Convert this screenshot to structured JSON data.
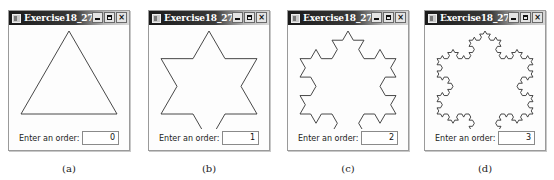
{
  "windows": [
    {
      "title": "Exercise18_27",
      "label": "Enter an order:",
      "order": "0",
      "caption": "(a)"
    },
    {
      "title": "Exercise18_27",
      "label": "Enter an order:",
      "order": "1",
      "caption": "(b)"
    },
    {
      "title": "Exercise18_27",
      "label": "Enter an order:",
      "order": "2",
      "caption": "(c)"
    },
    {
      "title": "Exercise18_27",
      "label": "Enter an order:",
      "order": "3",
      "caption": "(d)"
    }
  ],
  "controls": {
    "minimize": "minimize-icon",
    "maximize": "maximize-icon",
    "close": "×"
  },
  "colors": {
    "stroke": "#333333",
    "titlebar": "#1a1a1a"
  }
}
